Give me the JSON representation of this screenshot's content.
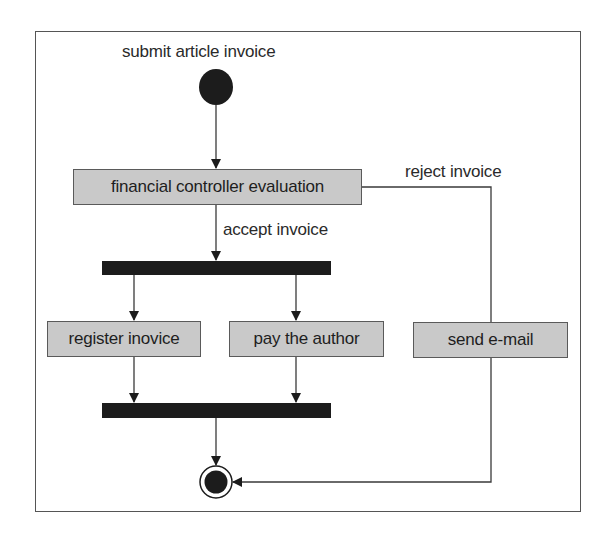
{
  "diagram": {
    "type": "UML activity diagram",
    "initial_node": {
      "label": "submit article invoice"
    },
    "actions": {
      "evaluation": "financial controller evaluation",
      "register": "register inovice",
      "pay": "pay the author",
      "email": "send e-mail"
    },
    "guards": {
      "accept": "accept invoice",
      "reject": "reject invoice"
    },
    "fork": {
      "name": "fork-bar"
    },
    "join": {
      "name": "join-bar"
    },
    "final_node": {
      "name": "final-node"
    },
    "flows": [
      {
        "from": "initial",
        "to": "financial controller evaluation"
      },
      {
        "from": "financial controller evaluation",
        "to": "fork",
        "guard": "accept invoice"
      },
      {
        "from": "financial controller evaluation",
        "to": "send e-mail",
        "guard": "reject invoice"
      },
      {
        "from": "fork",
        "to": "register inovice"
      },
      {
        "from": "fork",
        "to": "pay the author"
      },
      {
        "from": "register inovice",
        "to": "join"
      },
      {
        "from": "pay the author",
        "to": "join"
      },
      {
        "from": "join",
        "to": "final"
      },
      {
        "from": "send e-mail",
        "to": "final"
      }
    ],
    "colors": {
      "action_fill": "#c9c9c9",
      "node_fill": "#1c1c1c",
      "line": "#3a3a3a"
    }
  }
}
